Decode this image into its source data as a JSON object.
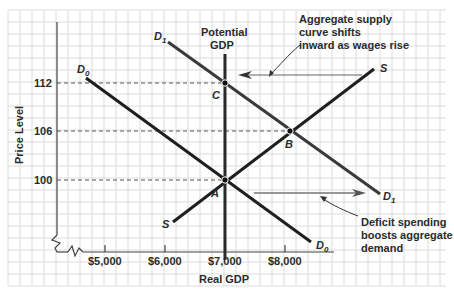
{
  "chart_data": {
    "type": "line",
    "title": "",
    "xlabel": "Real GDP",
    "ylabel": "Price Level",
    "x_ticks": [
      "$5,000",
      "$6,000",
      "$7,000",
      "$8,000"
    ],
    "y_ticks": [
      "100",
      "106",
      "112"
    ],
    "grid": true,
    "axis_break": true,
    "vertical_line": {
      "label_line1": "Potential",
      "label_line2": "GDP",
      "x": 7000
    },
    "series": [
      {
        "name": "D0",
        "label": "D",
        "sub": "0",
        "points": [
          [
            4650,
            112.6
          ],
          [
            8400,
            95.3
          ]
        ]
      },
      {
        "name": "D1",
        "label": "D",
        "sub": "1",
        "points": [
          [
            6050,
            116.3
          ],
          [
            9600,
            100.3
          ]
        ]
      },
      {
        "name": "S",
        "label": "S",
        "points": [
          [
            6150,
            97.8
          ],
          [
            9500,
            113.4
          ]
        ]
      }
    ],
    "points": [
      {
        "label": "A",
        "x": 7000,
        "y": 100
      },
      {
        "label": "B",
        "x": 8100,
        "y": 106
      },
      {
        "label": "C",
        "x": 7000,
        "y": 112
      }
    ],
    "annotations": [
      {
        "text_lines": [
          "Aggregate supply",
          "curve shifts",
          "inward as wages rise"
        ]
      },
      {
        "text_lines": [
          "Deficit spending",
          "boosts aggregate",
          "demand"
        ]
      }
    ]
  },
  "colors": {
    "grid": "#dcdcdc",
    "axis": "#444444",
    "curve": "#1f1f1f",
    "curve_d1": "#3a3a3a",
    "potential": "#2a2a2a",
    "arrow": "#555555",
    "text": "#2b2b2b"
  }
}
